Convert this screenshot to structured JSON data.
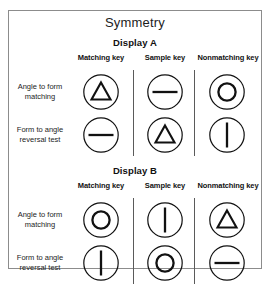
{
  "figure": {
    "title": "Symmetry",
    "border_color": "#8c8c8c",
    "ink_color": "#111111"
  },
  "row_labels": [
    "Angle to form matching",
    "Form to angle reversal test"
  ],
  "column_headers": [
    "Matching key",
    "Sample key",
    "Nonmatching key"
  ],
  "displays": [
    {
      "title": "Display A",
      "rows": [
        {
          "label": "Angle to form matching",
          "cells": [
            {
              "column": "Matching key",
              "shape": "triangle",
              "icon": "triangle-in-circle-icon"
            },
            {
              "column": "Sample key",
              "shape": "horizontal-line",
              "icon": "horizontal-line-in-circle-icon"
            },
            {
              "column": "Nonmatching key",
              "shape": "circle",
              "icon": "circle-in-circle-icon"
            }
          ]
        },
        {
          "label": "Form to angle reversal test",
          "cells": [
            {
              "column": "Matching key",
              "shape": "horizontal-line",
              "icon": "horizontal-line-in-circle-icon"
            },
            {
              "column": "Sample key",
              "shape": "triangle",
              "icon": "triangle-in-circle-icon"
            },
            {
              "column": "Nonmatching key",
              "shape": "vertical-line",
              "icon": "vertical-line-in-circle-icon"
            }
          ]
        }
      ]
    },
    {
      "title": "Display B",
      "rows": [
        {
          "label": "Angle to form matching",
          "cells": [
            {
              "column": "Matching key",
              "shape": "circle",
              "icon": "circle-in-circle-icon"
            },
            {
              "column": "Sample key",
              "shape": "vertical-line",
              "icon": "vertical-line-in-circle-icon"
            },
            {
              "column": "Nonmatching key",
              "shape": "triangle",
              "icon": "triangle-in-circle-icon"
            }
          ]
        },
        {
          "label": "Form to angle reversal test",
          "cells": [
            {
              "column": "Matching key",
              "shape": "vertical-line",
              "icon": "vertical-line-in-circle-icon"
            },
            {
              "column": "Sample key",
              "shape": "circle",
              "icon": "circle-in-circle-icon"
            },
            {
              "column": "Nonmatching key",
              "shape": "horizontal-line",
              "icon": "horizontal-line-in-circle-icon"
            }
          ]
        }
      ]
    }
  ]
}
